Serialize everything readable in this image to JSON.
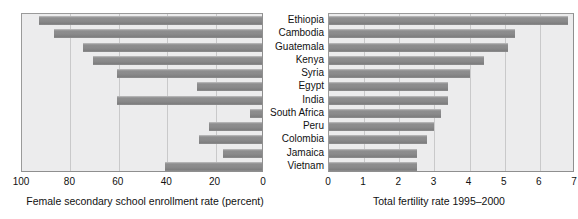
{
  "figure": {
    "width": 578,
    "height": 219,
    "background": "#ffffff",
    "bar_color": "#8a8a8b",
    "panel_color": "#ececed",
    "grid_color": "#c9c9ca",
    "frame_color": "#8f8f8f"
  },
  "categories": [
    "Ethiopia",
    "Cambodia",
    "Guatemala",
    "Kenya",
    "Syria",
    "Egypt",
    "India",
    "South Africa",
    "Peru",
    "Colombia",
    "Jamaica",
    "Vietnam"
  ],
  "chart_data": [
    {
      "type": "bar",
      "orientation": "horizontal",
      "id": "enrollment",
      "title": "",
      "xlabel": "Female secondary school enrollment rate (percent)",
      "ylabel": "",
      "xlim": [
        100,
        0
      ],
      "reversed_x_axis": true,
      "xticks": [
        100,
        80,
        60,
        40,
        20,
        0
      ],
      "xtick_labels": [
        "100",
        "80",
        "60",
        "40",
        "20",
        "0"
      ],
      "grid": true,
      "grid_axis": "x",
      "legend": false,
      "categories": [
        "Ethiopia",
        "Cambodia",
        "Guatemala",
        "Kenya",
        "Syria",
        "Egypt",
        "India",
        "South Africa",
        "Peru",
        "Colombia",
        "Jamaica",
        "Vietnam"
      ],
      "values": [
        8,
        14,
        26,
        30,
        40,
        73,
        40,
        95,
        78,
        74,
        84,
        60
      ]
    },
    {
      "type": "bar",
      "orientation": "horizontal",
      "id": "fertility",
      "title": "",
      "xlabel": "Total fertility rate 1995–2000",
      "ylabel": "",
      "xlim": [
        0,
        7
      ],
      "reversed_x_axis": false,
      "xticks": [
        0,
        1,
        2,
        3,
        4,
        5,
        6,
        7
      ],
      "xtick_labels": [
        "0",
        "1",
        "2",
        "3",
        "4",
        "5",
        "6",
        "7"
      ],
      "grid": true,
      "grid_axis": "x",
      "legend": false,
      "categories": [
        "Ethiopia",
        "Cambodia",
        "Guatemala",
        "Kenya",
        "Syria",
        "Egypt",
        "India",
        "South Africa",
        "Peru",
        "Colombia",
        "Jamaica",
        "Vietnam"
      ],
      "values": [
        6.8,
        5.3,
        5.1,
        4.4,
        4.0,
        3.4,
        3.4,
        3.2,
        3.0,
        2.8,
        2.5,
        2.5
      ]
    }
  ]
}
